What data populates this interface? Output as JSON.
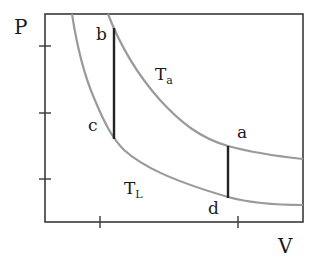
{
  "diagram": {
    "type": "PV diagram (thermodynamic cycle)",
    "axes": {
      "y_label": "P",
      "x_label": "V",
      "y_ticks": 3,
      "x_ticks": 2
    },
    "isotherms": [
      {
        "id": "upper",
        "label_main": "T",
        "label_sub": "a"
      },
      {
        "id": "lower",
        "label_main": "T",
        "label_sub": "L"
      }
    ],
    "points": [
      {
        "id": "a",
        "label": "a"
      },
      {
        "id": "b",
        "label": "b"
      },
      {
        "id": "c",
        "label": "c"
      },
      {
        "id": "d",
        "label": "d"
      }
    ],
    "segments": [
      {
        "from": "b",
        "to": "c",
        "kind": "isochoric"
      },
      {
        "from": "a",
        "to": "d",
        "kind": "isochoric"
      }
    ],
    "colors": {
      "isotherm": "#9a9a9a",
      "isochore": "#222222",
      "axes": "#3a3a3a"
    }
  }
}
